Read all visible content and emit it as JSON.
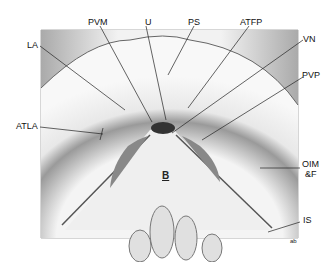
{
  "figure": {
    "labels": {
      "pvm": "PVM",
      "u": "U",
      "ps": "PS",
      "atfp": "ATFP",
      "vn": "VN",
      "la": "LA",
      "pvp": "PVP",
      "atla": "ATLA",
      "oim": "OIM",
      "f": "&F",
      "is": "IS",
      "b": "B",
      "signature": "ab"
    },
    "colors": {
      "line": "#222222",
      "background": "#ffffff",
      "tissue_light": "#eeeeee",
      "tissue_dark": "#555555"
    }
  }
}
